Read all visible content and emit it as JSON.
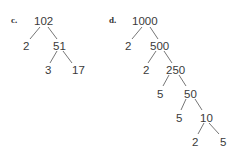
{
  "problems": [
    {
      "label": "c.",
      "tree": {
        "root": "102",
        "nodes": [
          "2",
          "51",
          "3",
          "17"
        ]
      }
    },
    {
      "label": "d.",
      "tree": {
        "root": "1000",
        "nodes": [
          "2",
          "500",
          "2",
          "250",
          "5",
          "50",
          "5",
          "10",
          "2",
          "5"
        ]
      }
    }
  ]
}
